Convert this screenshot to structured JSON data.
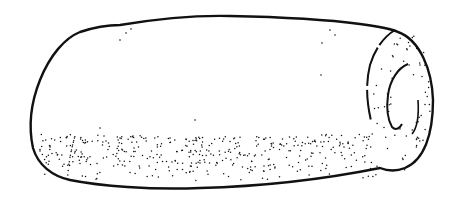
{
  "image": {
    "subject": "stippled line drawing of a cylindrical roll-shaped object",
    "alt": "Line drawing of a cylindrical object with a spiral end",
    "colors": {
      "background": "#ffffff",
      "ink": "#111111"
    }
  }
}
